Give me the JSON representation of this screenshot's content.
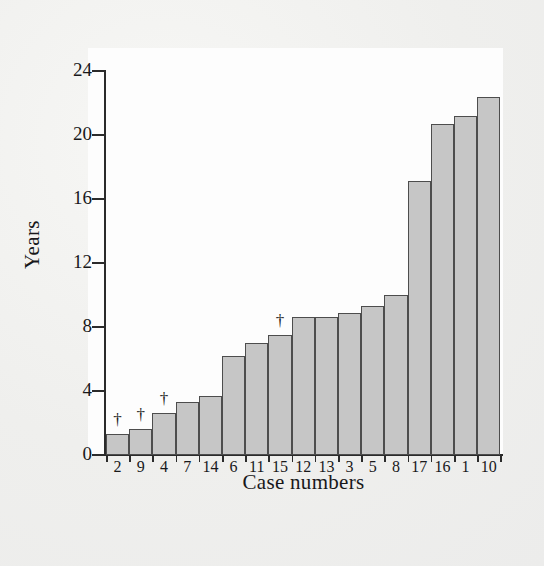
{
  "chart_data": {
    "type": "bar",
    "title": "",
    "subtitle": "",
    "xlabel": "Case numbers",
    "ylabel": "Years",
    "categories": [
      "2",
      "9",
      "4",
      "7",
      "14",
      "6",
      "11",
      "15",
      "12",
      "13",
      "3",
      "5",
      "8",
      "17",
      "16",
      "1",
      "10"
    ],
    "values": [
      1.3,
      1.6,
      2.6,
      3.3,
      3.7,
      6.2,
      7.0,
      7.5,
      8.6,
      8.6,
      8.9,
      9.3,
      10.0,
      17.1,
      20.7,
      21.2,
      22.4
    ],
    "ylim": [
      0,
      24
    ],
    "ytick_labels": [
      "0",
      "4",
      "8",
      "12",
      "16",
      "20",
      "24"
    ],
    "ytick_values": [
      0,
      4,
      8,
      12,
      16,
      20,
      24
    ],
    "grid": false,
    "legend": "none",
    "annotations": [
      {
        "category": "2",
        "symbol": "†"
      },
      {
        "category": "9",
        "symbol": "†"
      },
      {
        "category": "4",
        "symbol": "†"
      },
      {
        "category": "15",
        "symbol": "†"
      }
    ],
    "colors": {
      "bar_fill": "#c6c6c6",
      "bar_border": "#4d4d4d",
      "axis": "#2b2b2b",
      "text": "#18181a",
      "plot_background": "#fdfdfd",
      "page_background": "#efefed"
    }
  }
}
